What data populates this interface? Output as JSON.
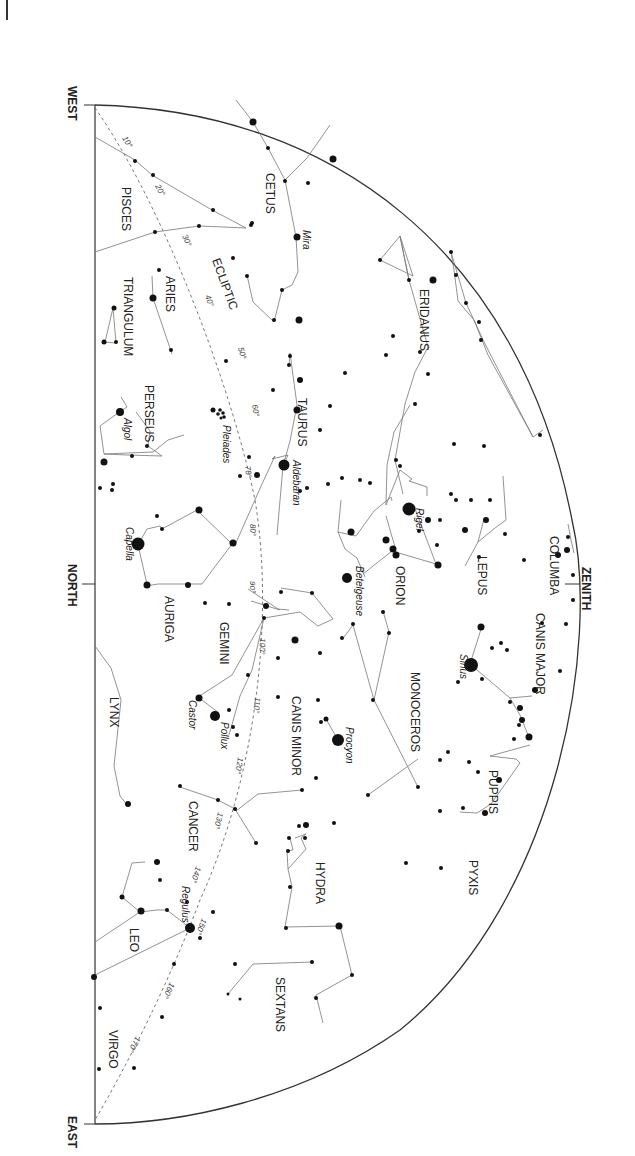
{
  "chart": {
    "directions": {
      "west": "WEST",
      "north": "NORTH",
      "east": "EAST",
      "zenith": "ZENITH"
    },
    "ecliptic_label": "ECLIPTIC",
    "ecliptic_ticks": [
      "10°",
      "20°",
      "30°",
      "40°",
      "50°",
      "60°",
      "70°",
      "80°",
      "90°",
      "100°",
      "110°",
      "120°",
      "130°",
      "140°",
      "150°",
      "160°",
      "170°"
    ],
    "constellations": [
      {
        "name": "CETUS"
      },
      {
        "name": "PISCES"
      },
      {
        "name": "ARIES"
      },
      {
        "name": "TRIANGULUM"
      },
      {
        "name": "ERIDANUS"
      },
      {
        "name": "PERSEUS"
      },
      {
        "name": "TAURUS"
      },
      {
        "name": "AURIGA"
      },
      {
        "name": "ORION"
      },
      {
        "name": "LEPUS"
      },
      {
        "name": "COLUMBA"
      },
      {
        "name": "GEMINI"
      },
      {
        "name": "CANIS MAJOR"
      },
      {
        "name": "MONOCEROS"
      },
      {
        "name": "CANIS MINOR"
      },
      {
        "name": "LYNX"
      },
      {
        "name": "PUPPIS"
      },
      {
        "name": "CANCER"
      },
      {
        "name": "HYDRA"
      },
      {
        "name": "PYXIS"
      },
      {
        "name": "LEO"
      },
      {
        "name": "SEXTANS"
      },
      {
        "name": "VIRGO"
      }
    ],
    "named_stars": [
      "Mira",
      "Algol",
      "Pleiades",
      "Aldebaran",
      "Rigel",
      "Capella",
      "Betelgeuse",
      "Sirius",
      "Castor",
      "Pollux",
      "Procyon",
      "Regulus"
    ]
  }
}
